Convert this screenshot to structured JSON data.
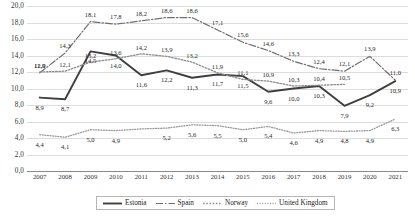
{
  "chart_data": {
    "type": "line",
    "title": "",
    "xlabel": "",
    "ylabel": "",
    "ylim": [
      0.0,
      20.0
    ],
    "ytick_step": 2.0,
    "grid": true,
    "legend_position": "bottom",
    "decimal_separator": ",",
    "yticks": [
      "0,0",
      "2,0",
      "4,0",
      "6,0",
      "8,0",
      "10,0",
      "12,0",
      "14,0",
      "16,0",
      "18,0",
      "20,0"
    ],
    "categories": [
      "2007",
      "2008",
      "2009",
      "2010",
      "2011",
      "2012",
      "2013",
      "2014",
      "2015",
      "2016",
      "2017",
      "2018",
      "2019",
      "2020",
      "2021"
    ],
    "series": [
      {
        "name": "Estonia",
        "style": "solid",
        "color": "#3f3f3f",
        "values": [
          8.9,
          8.7,
          14.5,
          14.0,
          11.6,
          12.2,
          11.3,
          11.7,
          11.5,
          9.6,
          10.0,
          10.3,
          7.9,
          9.2,
          10.9
        ],
        "labels": [
          "8,9",
          "8,7",
          "14,5",
          "14,0",
          "11,6",
          "12,2",
          "11,3",
          "11,7",
          "11,5",
          "9,6",
          "10,0",
          "10,3",
          "7,9",
          "9,2",
          "10,9"
        ]
      },
      {
        "name": "Spain",
        "style": "dashdot",
        "color": "#6f6f6f",
        "values": [
          11.9,
          14.3,
          18.1,
          17.8,
          18.2,
          18.6,
          18.6,
          17.1,
          15.6,
          14.6,
          13.3,
          12.4,
          12.1,
          13.9,
          11.0
        ],
        "labels": [
          "11,9",
          "14,3",
          "18,1",
          "17,8",
          "18,2",
          "18,6",
          "18,6",
          "17,1",
          "15,6",
          "14,6",
          "13,3",
          "12,4",
          "12,1",
          "13,9",
          "11,0"
        ]
      },
      {
        "name": "Norway",
        "style": "dotted",
        "color": "#8d8d8d",
        "values": [
          12.0,
          12.1,
          13.2,
          13.6,
          14.2,
          13.9,
          13.2,
          11.9,
          11.1,
          10.9,
          10.3,
          10.4,
          10.5,
          null,
          null
        ],
        "labels": [
          "12,0",
          "12,1",
          "13,2",
          "13,6",
          "14,2",
          "13,9",
          "13,2",
          "11,9",
          "11,1",
          "10,9",
          "10,3",
          "10,4",
          "10,5",
          "",
          ""
        ]
      },
      {
        "name": "United Kingdom",
        "style": "finedot",
        "color": "#9a9a9a",
        "values": [
          4.4,
          4.1,
          5.0,
          4.9,
          5.1,
          5.2,
          5.6,
          5.5,
          5.0,
          5.4,
          4.6,
          4.9,
          4.8,
          4.9,
          6.3
        ],
        "labels": [
          "4,4",
          "4,1",
          "5,0",
          "4,9",
          "",
          "5,2",
          "5,6",
          "5,5",
          "5,0",
          "5,4",
          "4,6",
          "4,9",
          "4,8",
          "4,9",
          "6,3"
        ]
      }
    ]
  },
  "legend": {
    "items": [
      {
        "label": "Estonia"
      },
      {
        "label": "Spain"
      },
      {
        "label": "Norway"
      },
      {
        "label": "United Kingdom"
      }
    ]
  }
}
